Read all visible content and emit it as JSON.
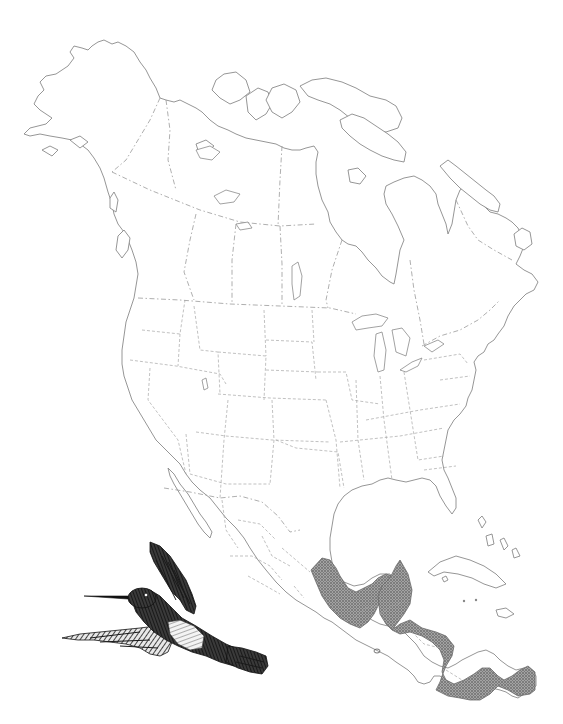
{
  "map": {
    "title": "",
    "region": "North America",
    "features": {
      "coastline": "North America outline (Alaska, Canada, Arctic islands, Greenland edge, USA, Mexico, Central America, Caribbean)",
      "borders": "dashed state/province/national boundaries",
      "range_area": "stippled range in southern Mexico and Central America"
    },
    "colors": {
      "background": "#ffffff",
      "coastline": "#8a8a8a",
      "border": "#9a9a9a",
      "range_fill": "#8c8c8c",
      "range_stipple": "#5a5a5a",
      "illustration": "#1a1a1a"
    },
    "illustration": {
      "subject": "hummingbird",
      "style": "black-and-white engraving"
    },
    "labels": []
  }
}
